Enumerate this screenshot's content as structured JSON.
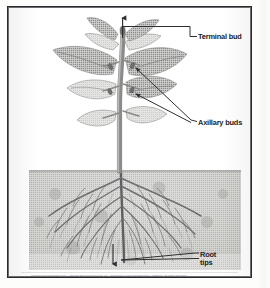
{
  "figure": {
    "style": "grayscale halftone scan",
    "colors": {
      "frame": "#2a2a2c",
      "background": "#ffffff",
      "soil": "#b4b4b2",
      "foliage": "#9a9a98",
      "stem": "#8d8d8b",
      "root": "#77777a",
      "label_text": "#1c1c1e",
      "leader_line": "#3a3a3c"
    }
  },
  "labels": {
    "terminal_bud": "Terminal bud",
    "axillary_buds": "Axillary buds",
    "root_tips_line1": "Root",
    "root_tips_line2": "tips"
  },
  "credit": {
    "text": "Reproduced with Permission. Copyright Pearson Education, Inc., publishing as Pearson Benjamin Cummings. All rights reserved."
  },
  "annotations": {
    "terminal_bud_marker": "up-arrow",
    "root_tips_marker": "down-arrow",
    "axillary_bud_pointer_count": 2,
    "root_tip_pointer_count": 2
  },
  "scene": {
    "soil_top_y": 162,
    "soil_label": "soil",
    "above_ground_label": "shoot system",
    "below_ground_label": "root system"
  }
}
